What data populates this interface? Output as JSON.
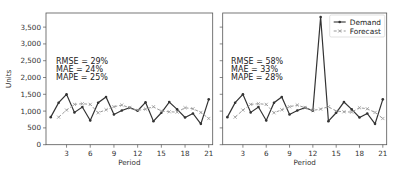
{
  "chart_data": [
    {
      "type": "line",
      "title": "",
      "xlabel": "Period",
      "ylabel": "Units",
      "xlim": [
        0.4,
        21.5
      ],
      "ylim": [
        0,
        3920
      ],
      "xticks": [
        3,
        6,
        9,
        12,
        15,
        18,
        21
      ],
      "yticks": [
        0,
        500,
        1000,
        1500,
        2000,
        2500,
        3000,
        3500
      ],
      "ytick_labels": [
        "0",
        "500",
        "1,000",
        "1,500",
        "2,000",
        "2,500",
        "3,000",
        "3,500"
      ],
      "grid": false,
      "legend": null,
      "annotations": [
        "RMSE = 29%",
        "MAE = 24%",
        "MAPE = 25%"
      ],
      "series": [
        {
          "name": "Demand",
          "x": [
            1,
            2,
            3,
            4,
            5,
            6,
            7,
            8,
            9,
            10,
            11,
            12,
            13,
            14,
            15,
            16,
            17,
            18,
            19,
            20,
            21
          ],
          "values": [
            820,
            1250,
            1500,
            960,
            1120,
            720,
            1250,
            1420,
            900,
            1020,
            1100,
            1010,
            1260,
            700,
            950,
            1270,
            1050,
            810,
            930,
            620,
            1350
          ]
        },
        {
          "name": "Forecast",
          "x": [
            2,
            3,
            4,
            5,
            6,
            7,
            8,
            9,
            10,
            11,
            12,
            13,
            14,
            15,
            16,
            17,
            18,
            19,
            20,
            21
          ],
          "values": [
            820,
            1030,
            1200,
            1220,
            1200,
            950,
            1040,
            1130,
            1180,
            1100,
            1020,
            1060,
            1130,
            1000,
            980,
            970,
            1100,
            1070,
            960,
            780
          ]
        }
      ]
    },
    {
      "type": "line",
      "title": "",
      "xlabel": "Period",
      "ylabel": "",
      "xlim": [
        0.4,
        21.5
      ],
      "ylim": [
        0,
        3920
      ],
      "xticks": [
        3,
        6,
        9,
        12,
        15,
        18,
        21
      ],
      "yticks": [
        0,
        500,
        1000,
        1500,
        2000,
        2500,
        3000,
        3500
      ],
      "ytick_labels": [],
      "grid": false,
      "legend": {
        "position": "upper right",
        "entries": [
          "Demand",
          "Forecast"
        ]
      },
      "annotations": [
        "RMSE = 58%",
        "MAE = 33%",
        "MAPE = 28%"
      ],
      "series": [
        {
          "name": "Demand",
          "x": [
            1,
            2,
            3,
            4,
            5,
            6,
            7,
            8,
            9,
            10,
            11,
            12,
            13,
            14,
            15,
            16,
            17,
            18,
            19,
            20,
            21
          ],
          "values": [
            820,
            1250,
            1500,
            960,
            1120,
            720,
            1250,
            1420,
            900,
            1020,
            1100,
            1010,
            3800,
            700,
            950,
            1270,
            1050,
            810,
            930,
            620,
            1350
          ]
        },
        {
          "name": "Forecast",
          "x": [
            2,
            3,
            4,
            5,
            6,
            7,
            8,
            9,
            10,
            11,
            12,
            13,
            14,
            15,
            16,
            17,
            18,
            19,
            20,
            21
          ],
          "values": [
            820,
            1030,
            1200,
            1220,
            1200,
            950,
            1040,
            1130,
            1180,
            1100,
            1020,
            1060,
            1130,
            1000,
            980,
            970,
            1100,
            1070,
            960,
            780
          ]
        }
      ]
    }
  ],
  "panels": [
    {
      "frame": {
        "x": 46,
        "y": 13,
        "w": 166.7,
        "h": 131.7
      },
      "show_y_labels": true,
      "annotation_pos": {
        "x": 56,
        "y": 64
      }
    },
    {
      "frame": {
        "x": 222.7,
        "y": 13,
        "w": 164,
        "h": 131.7
      },
      "show_y_labels": false,
      "annotation_pos": {
        "x": 231,
        "y": 64
      }
    }
  ],
  "style": {
    "demand_color": "#333333",
    "forecast_color": "#999999",
    "frame_color": "#555555",
    "text_color": "#333333"
  },
  "legend": {
    "demand_label": "Demand",
    "forecast_label": "Forecast"
  }
}
